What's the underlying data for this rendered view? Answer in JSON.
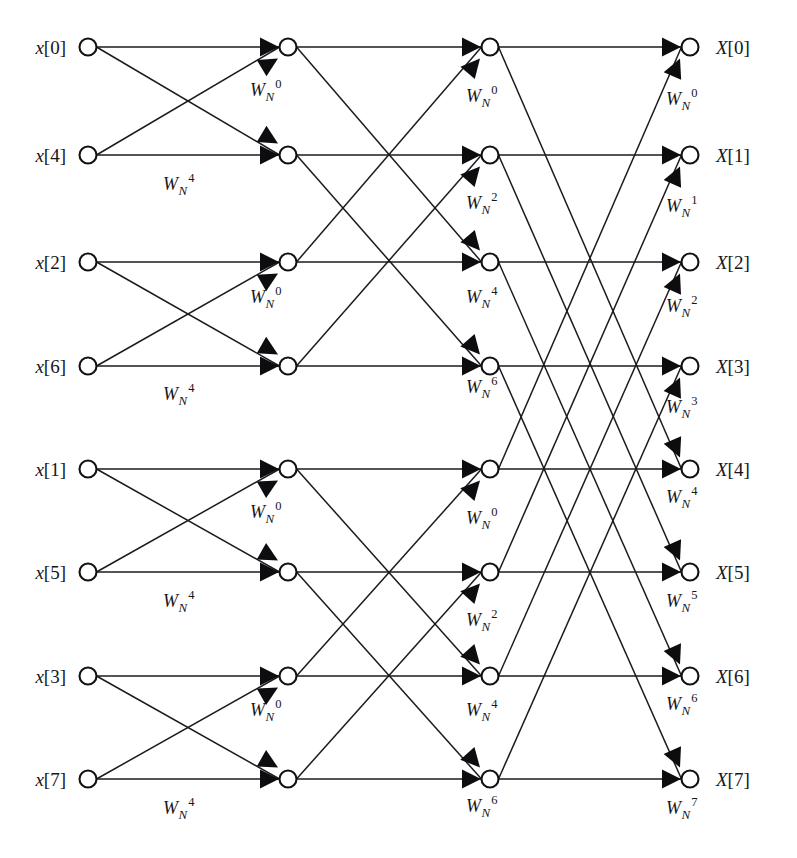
{
  "figure": {
    "kind": "fft-butterfly-signal-flow-graph",
    "background_color": "#ffffff",
    "line_color": "#1b1b1f",
    "node_fill": "#ffffff",
    "node_stroke": "#111115",
    "arrow_color": "#0d0d10",
    "stages": 3,
    "points": 8
  },
  "geometry": {
    "rows_y": [
      47,
      155,
      262,
      366,
      469,
      572,
      676,
      779
    ],
    "columns_x": [
      88,
      288,
      490,
      690
    ],
    "node_radius": 8.5,
    "input_label_x": 66,
    "output_label_x": 716
  },
  "inputs": [
    {
      "label": "x[0]",
      "var": "x",
      "index": "[0]",
      "row": 0
    },
    {
      "label": "x[4]",
      "var": "x",
      "index": "[4]",
      "row": 1
    },
    {
      "label": "x[2]",
      "var": "x",
      "index": "[2]",
      "row": 2
    },
    {
      "label": "x[6]",
      "var": "x",
      "index": "[6]",
      "row": 3
    },
    {
      "label": "x[1]",
      "var": "x",
      "index": "[1]",
      "row": 4
    },
    {
      "label": "x[5]",
      "var": "x",
      "index": "[5]",
      "row": 5
    },
    {
      "label": "x[3]",
      "var": "x",
      "index": "[3]",
      "row": 6
    },
    {
      "label": "x[7]",
      "var": "x",
      "index": "[7]",
      "row": 7
    }
  ],
  "outputs": [
    {
      "label": "X[0]",
      "var": "X",
      "index": "[0]",
      "row": 0
    },
    {
      "label": "X[1]",
      "var": "X",
      "index": "[1]",
      "row": 1
    },
    {
      "label": "X[2]",
      "var": "X",
      "index": "[2]",
      "row": 2
    },
    {
      "label": "X[3]",
      "var": "X",
      "index": "[3]",
      "row": 3
    },
    {
      "label": "X[4]",
      "var": "X",
      "index": "[4]",
      "row": 4
    },
    {
      "label": "X[5]",
      "var": "X",
      "index": "[5]",
      "row": 5
    },
    {
      "label": "X[6]",
      "var": "X",
      "index": "[6]",
      "row": 6
    },
    {
      "label": "X[7]",
      "var": "X",
      "index": "[7]",
      "row": 7
    }
  ],
  "twiddle_symbol": {
    "base": "W",
    "subscript": "N",
    "text_template": "W_N^k"
  },
  "twiddles": [
    {
      "stage": 1,
      "row": 0,
      "exponent": "0",
      "text": "W_N^0",
      "x": 250,
      "y": 96
    },
    {
      "stage": 1,
      "row": 1,
      "exponent": "4",
      "text": "W_N^4",
      "x": 163,
      "y": 190
    },
    {
      "stage": 1,
      "row": 2,
      "exponent": "0",
      "text": "W_N^0",
      "x": 250,
      "y": 303
    },
    {
      "stage": 1,
      "row": 3,
      "exponent": "4",
      "text": "W_N^4",
      "x": 163,
      "y": 400
    },
    {
      "stage": 1,
      "row": 4,
      "exponent": "0",
      "text": "W_N^0",
      "x": 250,
      "y": 518
    },
    {
      "stage": 1,
      "row": 5,
      "exponent": "4",
      "text": "W_N^4",
      "x": 163,
      "y": 607
    },
    {
      "stage": 1,
      "row": 6,
      "exponent": "0",
      "text": "W_N^0",
      "x": 250,
      "y": 716
    },
    {
      "stage": 1,
      "row": 7,
      "exponent": "4",
      "text": "W_N^4",
      "x": 163,
      "y": 814
    },
    {
      "stage": 2,
      "row": 0,
      "exponent": "0",
      "text": "W_N^0",
      "x": 466,
      "y": 102
    },
    {
      "stage": 2,
      "row": 1,
      "exponent": "2",
      "text": "W_N^2",
      "x": 466,
      "y": 209
    },
    {
      "stage": 2,
      "row": 2,
      "exponent": "4",
      "text": "W_N^4",
      "x": 466,
      "y": 303
    },
    {
      "stage": 2,
      "row": 3,
      "exponent": "6",
      "text": "W_N^6",
      "x": 466,
      "y": 393
    },
    {
      "stage": 2,
      "row": 4,
      "exponent": "0",
      "text": "W_N^0",
      "x": 466,
      "y": 524
    },
    {
      "stage": 2,
      "row": 5,
      "exponent": "2",
      "text": "W_N^2",
      "x": 466,
      "y": 626
    },
    {
      "stage": 2,
      "row": 6,
      "exponent": "4",
      "text": "W_N^4",
      "x": 466,
      "y": 716
    },
    {
      "stage": 2,
      "row": 7,
      "exponent": "6",
      "text": "W_N^6",
      "x": 466,
      "y": 812
    },
    {
      "stage": 3,
      "row": 0,
      "exponent": "0",
      "text": "W_N^0",
      "x": 666,
      "y": 105
    },
    {
      "stage": 3,
      "row": 1,
      "exponent": "1",
      "text": "W_N^1",
      "x": 666,
      "y": 212
    },
    {
      "stage": 3,
      "row": 2,
      "exponent": "2",
      "text": "W_N^2",
      "x": 666,
      "y": 312
    },
    {
      "stage": 3,
      "row": 3,
      "exponent": "3",
      "text": "W_N^3",
      "x": 666,
      "y": 413
    },
    {
      "stage": 3,
      "row": 4,
      "exponent": "4",
      "text": "W_N^4",
      "x": 666,
      "y": 503
    },
    {
      "stage": 3,
      "row": 5,
      "exponent": "5",
      "text": "W_N^5",
      "x": 666,
      "y": 607
    },
    {
      "stage": 3,
      "row": 6,
      "exponent": "6",
      "text": "W_N^6",
      "x": 666,
      "y": 710
    },
    {
      "stage": 3,
      "row": 7,
      "exponent": "7",
      "text": "W_N^7",
      "x": 666,
      "y": 814
    }
  ],
  "edges": {
    "stage1_span": 1,
    "stage2_span": 2,
    "stage3_span": 4,
    "stage1_pairs": [
      [
        0,
        1
      ],
      [
        2,
        3
      ],
      [
        4,
        5
      ],
      [
        6,
        7
      ]
    ],
    "stage2_pairs": [
      [
        0,
        2
      ],
      [
        1,
        3
      ],
      [
        4,
        6
      ],
      [
        5,
        7
      ]
    ],
    "stage3_pairs": [
      [
        0,
        4
      ],
      [
        1,
        5
      ],
      [
        2,
        6
      ],
      [
        3,
        7
      ]
    ]
  }
}
